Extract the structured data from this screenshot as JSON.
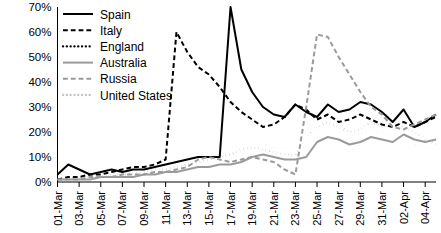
{
  "chart_data": {
    "type": "line",
    "title": "",
    "xlabel": "",
    "ylabel": "",
    "ylim": [
      0,
      70
    ],
    "grid": false,
    "legend_position": "top-left",
    "ytick_labels": [
      "0%",
      "10%",
      "20%",
      "30%",
      "40%",
      "50%",
      "60%",
      "70%"
    ],
    "ytick_values": [
      0,
      10,
      20,
      30,
      40,
      50,
      60,
      70
    ],
    "xtick_labels": [
      "01-Mar",
      "03-Mar",
      "05-Mar",
      "07-Mar",
      "09-Mar",
      "11-Mar",
      "13-Mar",
      "15-Mar",
      "17-Mar",
      "19-Mar",
      "21-Mar",
      "23-Mar",
      "25-Mar",
      "27-Mar",
      "29-Mar",
      "31-Mar",
      "02-Apr",
      "04-Apr"
    ],
    "x": [
      "01-Mar",
      "02-Mar",
      "03-Mar",
      "04-Mar",
      "05-Mar",
      "06-Mar",
      "07-Mar",
      "08-Mar",
      "09-Mar",
      "10-Mar",
      "11-Mar",
      "12-Mar",
      "13-Mar",
      "14-Mar",
      "15-Mar",
      "16-Mar",
      "17-Mar",
      "18-Mar",
      "19-Mar",
      "20-Mar",
      "21-Mar",
      "22-Mar",
      "23-Mar",
      "24-Mar",
      "25-Mar",
      "26-Mar",
      "27-Mar",
      "28-Mar",
      "29-Mar",
      "30-Mar",
      "31-Mar",
      "01-Apr",
      "02-Apr",
      "03-Apr",
      "04-Apr",
      "05-Apr"
    ],
    "series": [
      {
        "name": "Spain",
        "color": "#000000",
        "style": "solid",
        "width": 2.0,
        "values": [
          3,
          7,
          5,
          3,
          4,
          5,
          4,
          5,
          5,
          6,
          7,
          8,
          9,
          10,
          10,
          10,
          70,
          45,
          36,
          30,
          27,
          26,
          31,
          28,
          26,
          31,
          28,
          29,
          32,
          31,
          28,
          24,
          29,
          22,
          24,
          27
        ]
      },
      {
        "name": "Italy",
        "color": "#000000",
        "style": "dashed",
        "width": 2.0,
        "values": [
          1,
          2,
          2,
          3,
          3,
          4,
          5,
          6,
          6,
          7,
          9,
          60,
          52,
          46,
          43,
          38,
          32,
          28,
          25,
          22,
          23,
          26,
          31,
          29,
          25,
          27,
          24,
          25,
          27,
          25,
          23,
          22,
          24,
          22,
          24,
          26
        ]
      },
      {
        "name": "England",
        "color": "#000000",
        "style": "dotted",
        "width": 2.3,
        "values": [
          1,
          1,
          2,
          2,
          2,
          3,
          3,
          3,
          4,
          5,
          5,
          6,
          7,
          8,
          9,
          10,
          11,
          13,
          14,
          13,
          12,
          11,
          11,
          18,
          22,
          24,
          22,
          20,
          21,
          24,
          22,
          24,
          22,
          20,
          17,
          15
        ]
      },
      {
        "name": "Australia",
        "color": "#9a9a9a",
        "style": "solid",
        "width": 2.0,
        "values": [
          1,
          1,
          1,
          1,
          2,
          2,
          2,
          2,
          3,
          3,
          4,
          4,
          5,
          6,
          6,
          7,
          7,
          8,
          10,
          11,
          10,
          9,
          9,
          10,
          16,
          18,
          17,
          15,
          16,
          18,
          17,
          16,
          19,
          17,
          16,
          17
        ]
      },
      {
        "name": "Russia",
        "color": "#9a9a9a",
        "style": "dashed",
        "width": 2.0,
        "values": [
          1,
          1,
          1,
          2,
          2,
          2,
          3,
          3,
          3,
          4,
          4,
          5,
          6,
          9,
          10,
          9,
          8,
          9,
          10,
          9,
          8,
          5,
          3,
          30,
          59,
          58,
          50,
          43,
          36,
          30,
          27,
          22,
          21,
          23,
          25,
          27
        ]
      },
      {
        "name": "United States",
        "color": "#c2c2c2",
        "style": "dotted",
        "width": 2.3,
        "values": [
          1,
          1,
          2,
          2,
          2,
          3,
          3,
          4,
          4,
          5,
          5,
          6,
          7,
          8,
          9,
          10,
          11,
          12,
          13,
          15,
          14,
          13,
          16,
          20,
          22,
          23,
          22,
          20,
          19,
          21,
          20,
          19,
          17,
          15,
          14,
          13
        ]
      }
    ]
  },
  "legend": {
    "items": [
      {
        "label": "Spain"
      },
      {
        "label": "Italy"
      },
      {
        "label": "England"
      },
      {
        "label": "Australia"
      },
      {
        "label": "Russia"
      },
      {
        "label": "United States"
      }
    ]
  }
}
